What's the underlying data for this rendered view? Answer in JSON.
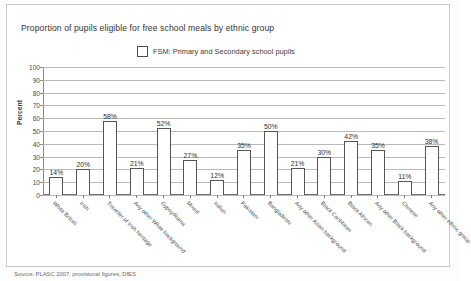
{
  "chart_data": {
    "type": "bar",
    "title": "Proportion of pupils eligible for free school meals by ethnic group",
    "xlabel": "",
    "ylabel": "Percent",
    "ylim": [
      0,
      100
    ],
    "ytick_step": 10,
    "yticks": [
      "100",
      "90",
      "80",
      "70",
      "60",
      "50",
      "40",
      "30",
      "20",
      "10",
      "0"
    ],
    "grid": true,
    "legend_position": "top-center",
    "legend": [
      "FSM: Primary and Secondary school pupils"
    ],
    "value_suffix": "%",
    "categories": [
      "White British",
      "Irish",
      "Traveller of Irish heritage",
      "Any other White background",
      "Gypsy/Roma",
      "Mixed",
      "Indian",
      "Pakistani",
      "Bangladeshi",
      "Any other Asian background",
      "Black Caribbean",
      "Black African",
      "Any other Black background",
      "Chinese",
      "Any other ethnic group"
    ],
    "values": [
      14,
      20,
      58,
      21,
      52,
      27,
      12,
      35,
      50,
      21,
      30,
      42,
      35,
      11,
      38
    ],
    "value_labels": [
      "14%",
      "20%",
      "58%",
      "21%",
      "52%",
      "27%",
      "12%",
      "35%",
      "50%",
      "21%",
      "30%",
      "42%",
      "35%",
      "11%",
      "38%"
    ],
    "series": [
      {
        "name": "FSM: Primary and Secondary school pupils",
        "values": [
          14,
          20,
          58,
          21,
          52,
          27,
          12,
          35,
          50,
          21,
          30,
          42,
          35,
          11,
          38
        ]
      }
    ]
  },
  "source_note": "Source: PLASC 2007, provisional figures, DfES"
}
